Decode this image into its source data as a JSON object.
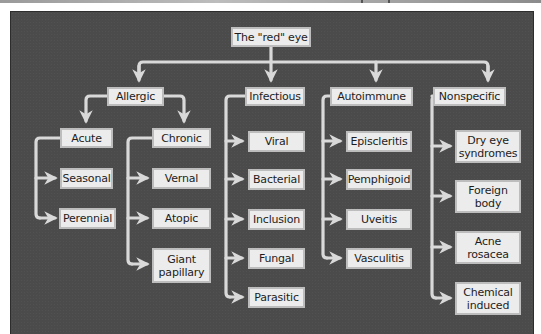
{
  "diagram": {
    "type": "tree",
    "root": {
      "label": "The \"red\" eye"
    },
    "categories": [
      {
        "label": "Allergic",
        "subgroups": [
          {
            "label": "Acute",
            "children": [
              "Seasonal",
              "Perennial"
            ]
          },
          {
            "label": "Chronic",
            "children": [
              "Vernal",
              "Atopic",
              "Giant\npapillary"
            ]
          }
        ]
      },
      {
        "label": "Infectious",
        "children": [
          "Viral",
          "Bacterial",
          "Inclusion",
          "Fungal",
          "Parasitic"
        ]
      },
      {
        "label": "Autoimmune",
        "children": [
          "Episcleritis",
          "Pemphigoid",
          "Uveitis",
          "Vasculitis"
        ]
      },
      {
        "label": "Nonspecific",
        "children": [
          "Dry eye\nsyndromes",
          "Foreign\nbody",
          "Acne\nrosacea",
          "Chemical\ninduced"
        ]
      }
    ],
    "colors": {
      "background": "#4b4b4b",
      "node_fill": "#ececec",
      "node_border": "#bdbdbd",
      "connector": "#d9d9d9",
      "text": "#1d1d1d"
    }
  }
}
